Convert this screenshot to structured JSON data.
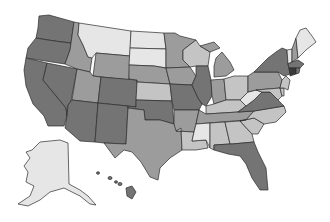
{
  "map": {
    "title": "",
    "type": "choropleth",
    "region": "United States",
    "palette": {
      "darkest": "#3a3a3a",
      "dark": "#747474",
      "medium": "#9c9c9c",
      "light": "#c4c4c4",
      "lightest": "#e6e6e6",
      "border": "#2b2b2b",
      "background": "#ffffff"
    },
    "states": [
      {
        "code": "WA",
        "shade": "dark"
      },
      {
        "code": "OR",
        "shade": "dark"
      },
      {
        "code": "CA",
        "shade": "dark"
      },
      {
        "code": "NV",
        "shade": "dark"
      },
      {
        "code": "ID",
        "shade": "medium"
      },
      {
        "code": "MT",
        "shade": "lightest"
      },
      {
        "code": "WY",
        "shade": "medium"
      },
      {
        "code": "UT",
        "shade": "medium"
      },
      {
        "code": "AZ",
        "shade": "dark"
      },
      {
        "code": "CO",
        "shade": "dark"
      },
      {
        "code": "NM",
        "shade": "dark"
      },
      {
        "code": "ND",
        "shade": "lightest"
      },
      {
        "code": "SD",
        "shade": "lightest"
      },
      {
        "code": "NE",
        "shade": "medium"
      },
      {
        "code": "KS",
        "shade": "light"
      },
      {
        "code": "OK",
        "shade": "dark"
      },
      {
        "code": "TX",
        "shade": "medium"
      },
      {
        "code": "MN",
        "shade": "medium"
      },
      {
        "code": "IA",
        "shade": "medium"
      },
      {
        "code": "MO",
        "shade": "dark"
      },
      {
        "code": "AR",
        "shade": "medium"
      },
      {
        "code": "LA",
        "shade": "light"
      },
      {
        "code": "WI",
        "shade": "light"
      },
      {
        "code": "IL",
        "shade": "dark"
      },
      {
        "code": "MI",
        "shade": "medium"
      },
      {
        "code": "IN",
        "shade": "medium"
      },
      {
        "code": "OH",
        "shade": "light"
      },
      {
        "code": "KY",
        "shade": "light"
      },
      {
        "code": "TN",
        "shade": "medium"
      },
      {
        "code": "MS",
        "shade": "lightest"
      },
      {
        "code": "AL",
        "shade": "light"
      },
      {
        "code": "GA",
        "shade": "light"
      },
      {
        "code": "FL",
        "shade": "dark"
      },
      {
        "code": "SC",
        "shade": "light"
      },
      {
        "code": "NC",
        "shade": "light"
      },
      {
        "code": "VA",
        "shade": "dark"
      },
      {
        "code": "WV",
        "shade": "lightest"
      },
      {
        "code": "PA",
        "shade": "medium"
      },
      {
        "code": "NY",
        "shade": "dark"
      },
      {
        "code": "VT",
        "shade": "lightest"
      },
      {
        "code": "NH",
        "shade": "medium"
      },
      {
        "code": "ME",
        "shade": "lightest"
      },
      {
        "code": "MA",
        "shade": "dark"
      },
      {
        "code": "CT",
        "shade": "darkest"
      },
      {
        "code": "RI",
        "shade": "dark"
      },
      {
        "code": "NJ",
        "shade": "light"
      },
      {
        "code": "DE",
        "shade": "light"
      },
      {
        "code": "MD",
        "shade": "light"
      },
      {
        "code": "AK",
        "shade": "lightest"
      },
      {
        "code": "HI",
        "shade": "dark"
      }
    ]
  }
}
